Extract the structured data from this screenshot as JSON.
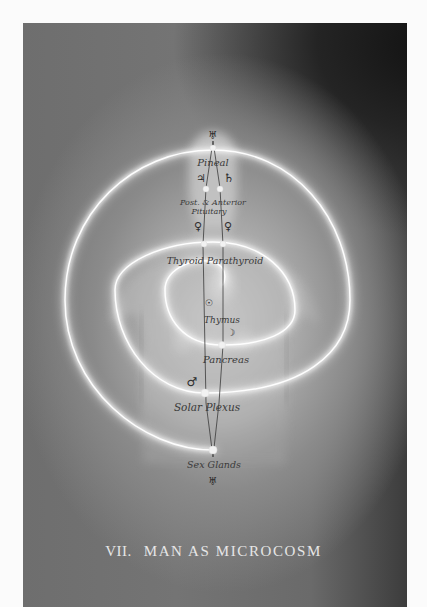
{
  "plate": {
    "caption_number": "VII.",
    "caption_title": "MAN AS MICROCOSM",
    "colors": {
      "page_margin": "#fbfbfb",
      "background_dark": "#1a1a1a",
      "background_mid": "#707070",
      "background_light": "#bdbdbd",
      "spiral_glow": "#f4f4f4",
      "label_ink": "#3a3a3a",
      "caption_text": "#e6e6e6"
    }
  },
  "glands": [
    {
      "id": "pineal",
      "label": "Pineal"
    },
    {
      "id": "pituitary",
      "label_line1": "Post. & Anterior",
      "label_line2": "Pituitary"
    },
    {
      "id": "thyroid",
      "label": "Thyroid Parathyroid"
    },
    {
      "id": "thymus",
      "label": "Thymus"
    },
    {
      "id": "pancreas",
      "label": "Pancreas"
    },
    {
      "id": "solar-plexus",
      "label": "Solar Plexus"
    },
    {
      "id": "sex-glands",
      "label": "Sex Glands"
    }
  ],
  "symbols": {
    "top": "♅",
    "jupiter": "♃",
    "saturn": "♄",
    "venus_left": "♀",
    "venus_right": "♀",
    "sun": "☉",
    "moon": "☽",
    "mars": "♂",
    "bottom": "♅"
  }
}
